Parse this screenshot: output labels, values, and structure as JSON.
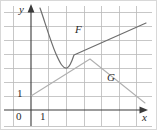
{
  "figure": {
    "background": "#ffffff",
    "width": 157,
    "height": 130,
    "grid_color": "#b9b9b9",
    "axis_color": "#3a3a3a",
    "curve_f_color": "#6e6e6e",
    "curve_g_color": "#b0b0b0",
    "border_color": "#d8d8d8"
  },
  "labels": {
    "y_axis": "y",
    "x_axis": "x",
    "curve_f": "F",
    "curve_g": "G",
    "tick_origin": "0",
    "tick_x_one": "1",
    "tick_y_one": "1"
  },
  "chart_data": {
    "type": "line",
    "title": "",
    "xlabel": "x",
    "ylabel": "y",
    "grid": true,
    "legend": "inline-annotations",
    "xlim": [
      -1,
      7
    ],
    "ylim": [
      -1,
      7
    ],
    "x_ticks": [
      0,
      1
    ],
    "y_ticks": [
      1
    ],
    "x_tick_labels": [
      "0",
      "1"
    ],
    "y_tick_labels": [
      "1"
    ],
    "annotations": [
      {
        "text": "F",
        "x": 2.4,
        "y": 4.1
      },
      {
        "text": "G",
        "x": 4.2,
        "y": 1.8
      }
    ],
    "series": [
      {
        "name": "F",
        "label": "F",
        "color": "#6e6e6e",
        "shape": "curve-then-line",
        "description": "Decreasing curve from upper left, local minimum near x=1.75, then rising into a straight ray",
        "points": [
          [
            0.52,
            7.05
          ],
          [
            0.7,
            6.1
          ],
          [
            0.88,
            5.25
          ],
          [
            1.06,
            4.55
          ],
          [
            1.24,
            4.0
          ],
          [
            1.42,
            3.62
          ],
          [
            1.6,
            3.42
          ],
          [
            1.78,
            3.38
          ],
          [
            1.96,
            3.52
          ],
          [
            2.14,
            3.82
          ],
          [
            2.32,
            4.0
          ],
          [
            2.6,
            4.22
          ],
          [
            3.2,
            4.52
          ],
          [
            4.0,
            4.92
          ],
          [
            4.8,
            5.32
          ],
          [
            5.6,
            5.72
          ],
          [
            6.45,
            6.15
          ]
        ]
      },
      {
        "name": "G",
        "label": "G",
        "color": "#b0b0b0",
        "shape": "piecewise-linear",
        "description": "Rises linearly from (0,1) to a peak at (3.35,3.60) then falls linearly to (6.45,0.50)",
        "points": [
          [
            0.0,
            1.0
          ],
          [
            3.35,
            3.6
          ],
          [
            6.45,
            0.5
          ]
        ]
      }
    ]
  },
  "geometry": {
    "origin_px": {
      "x": 31,
      "y": 110
    },
    "grid_step_px": {
      "x": 17.6,
      "y": 14.0
    },
    "grid_vertical_px": [
      13,
      31,
      48,
      66,
      84,
      101,
      119,
      136
    ],
    "grid_horizontal_px": [
      12,
      26,
      40,
      54,
      68,
      82,
      96,
      110
    ],
    "y_axis_px": {
      "x": 31,
      "top": 6,
      "bottom": 126
    },
    "x_axis_px": {
      "y": 110,
      "left": 4,
      "right": 147
    },
    "curve_f_path": "M 40,8 C 45,22 50,40 56,54 C 60,63 63,69 67,68 C 70,67 72,61 74,55 L 146,23",
    "curve_g_path": "M 31,96 L 90,59 L 145,103",
    "label_positions_px": {
      "y_axis": {
        "x": 20,
        "y": 6
      },
      "x_axis": {
        "x": 143,
        "y": 114
      },
      "curve_f": {
        "x": 76,
        "y": 30
      },
      "curve_g": {
        "x": 108,
        "y": 78
      },
      "tick_origin": {
        "x": 17,
        "y": 113
      },
      "tick_x_one": {
        "x": 41,
        "y": 113
      },
      "tick_y_one": {
        "x": 17,
        "y": 90
      }
    }
  }
}
